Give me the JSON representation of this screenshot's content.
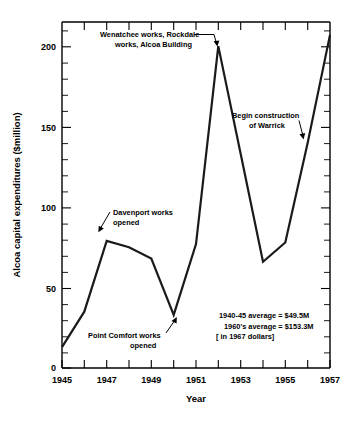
{
  "chart_data": {
    "type": "line",
    "title": "",
    "xlabel": "Year",
    "ylabel": "Alcoa capital expenditures ($million)",
    "xlim": [
      1945,
      1957
    ],
    "ylim": [
      0,
      215
    ],
    "grid": false,
    "legend": "none",
    "x": [
      1945,
      1946,
      1947,
      1948,
      1949,
      1950,
      1951,
      1952,
      1953,
      1954,
      1955,
      1956,
      1957
    ],
    "values": [
      13,
      35,
      79,
      75,
      68,
      33,
      77,
      200,
      133,
      66,
      78,
      140,
      207
    ],
    "series": [
      {
        "name": "Alcoa capital expenditures",
        "values": [
          13,
          35,
          79,
          75,
          68,
          33,
          77,
          200,
          133,
          66,
          78,
          140,
          207
        ]
      }
    ],
    "y_ticks": [
      0,
      50,
      100,
      150,
      200
    ],
    "y_tick_labels": [
      "0",
      "50",
      "100",
      "150",
      "200"
    ],
    "y_minor_step": 10,
    "x_ticks": [
      1945,
      1946,
      1947,
      1948,
      1949,
      1950,
      1951,
      1952,
      1953,
      1954,
      1955,
      1956,
      1957
    ],
    "x_tick_labels": [
      "1945",
      "",
      "1947",
      "",
      "1949",
      "",
      "1951",
      "",
      "1953",
      "",
      "1955",
      "",
      "1957"
    ],
    "x_labeled_ticks": [
      "1945",
      "1947",
      "1949",
      "1951",
      "1953",
      "1955",
      "1957"
    ],
    "annotations": [
      {
        "id": "wenatchee",
        "lines": [
          "Wenatchee works, Rockdale",
          "works, Alcoa Building"
        ],
        "points_to_year": 1952,
        "points_to_value": 200
      },
      {
        "id": "davenport",
        "lines": [
          "Davenport works",
          "opened"
        ],
        "points_to_year": 1947,
        "points_to_value": 79
      },
      {
        "id": "point-comfort",
        "lines": [
          "Point Comfort works",
          "opened"
        ],
        "points_to_year": 1950,
        "points_to_value": 33
      },
      {
        "id": "warrick",
        "lines": [
          "Begin construction",
          "of Warrick"
        ],
        "points_to_year": 1956,
        "points_to_value": 140
      }
    ],
    "stat_note": [
      "1940-45 average = $49.5M",
      "1960's average = $153.3M",
      "[ in 1967 dollars]"
    ]
  },
  "labels": {
    "y_axis_title": "Alcoa capital expenditures ($million)",
    "x_axis_title": "Year",
    "ytick_0": "0",
    "ytick_50": "50",
    "ytick_100": "100",
    "ytick_150": "150",
    "ytick_200": "200",
    "xtick_1945": "1945",
    "xtick_1947": "1947",
    "xtick_1949": "1949",
    "xtick_1951": "1951",
    "xtick_1953": "1953",
    "xtick_1955": "1955",
    "xtick_1957": "1957",
    "anno_wenatchee_l1": "Wenatchee works, Rockdale",
    "anno_wenatchee_l2": "works, Alcoa Building",
    "anno_davenport_l1": "Davenport works",
    "anno_davenport_l2": "opened",
    "anno_pointcomfort_l1": "Point Comfort works",
    "anno_pointcomfort_l2": "opened",
    "anno_warrick_l1": "Begin construction",
    "anno_warrick_l2": "of Warrick",
    "stat_l1": "1940-45 average = $49.5M",
    "stat_l2": "1960's average = $153.3M",
    "stat_l3": "[ in 1967 dollars]"
  },
  "colors": {
    "line": "#1a1a1a",
    "axis": "#000000",
    "background": "#ffffff"
  }
}
